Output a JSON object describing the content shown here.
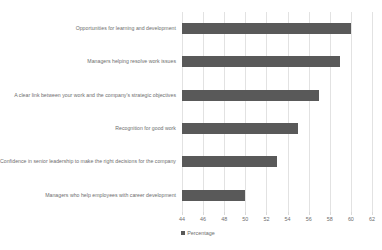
{
  "chart_data": {
    "type": "bar",
    "orientation": "horizontal",
    "title": "",
    "xlabel": "",
    "ylabel": "",
    "xlim": [
      44,
      62
    ],
    "xtick_step": 2,
    "grid": true,
    "legend_position": "bottom",
    "categories": [
      "Opportunities for learning and development",
      "Managers helping resolve work issues",
      "A clear link between your work and the company's strategic objectives",
      "Recognition for good work",
      "Confidence in senior leadership to make the right decisions for the company",
      "Managers who help employees with career development"
    ],
    "values": [
      60,
      59,
      57,
      55,
      53,
      50
    ],
    "series": [
      {
        "name": "Percentage",
        "values": [
          60,
          59,
          57,
          55,
          53,
          50
        ],
        "color": "#595959"
      }
    ],
    "xticks": [
      44,
      46,
      48,
      50,
      52,
      54,
      56,
      58,
      60,
      62
    ],
    "xtick_labels": [
      "44",
      "46",
      "48",
      "50",
      "52",
      "54",
      "56",
      "58",
      "60",
      "62"
    ]
  },
  "legend": {
    "entries": [
      {
        "label": "Percentage",
        "color": "#595959"
      }
    ]
  },
  "style": {
    "bar_color": "#595959",
    "grid_color": "#e2e2e2",
    "text_color": "#6e6e6e",
    "background": "#ffffff"
  }
}
